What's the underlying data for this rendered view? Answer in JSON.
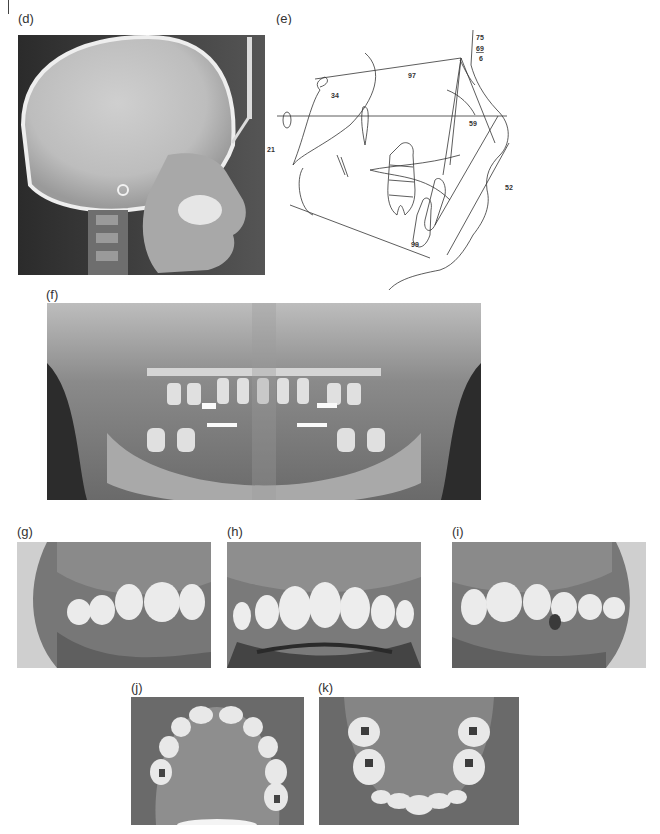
{
  "figure": {
    "panels": [
      {
        "id": "d",
        "label": "(d)",
        "description": "Lateral cephalometric radiograph"
      },
      {
        "id": "e",
        "label": "(e)",
        "description": "Cephalometric tracing"
      },
      {
        "id": "f",
        "label": "(f)",
        "description": "Panoramic radiograph"
      },
      {
        "id": "g",
        "label": "(g)",
        "description": "Intraoral photo, right buccal"
      },
      {
        "id": "h",
        "label": "(h)",
        "description": "Intraoral photo, frontal"
      },
      {
        "id": "i",
        "label": "(i)",
        "description": "Intraoral photo, left buccal"
      },
      {
        "id": "j",
        "label": "(j)",
        "description": "Maxillary occlusal photo"
      },
      {
        "id": "k",
        "label": "(k)",
        "description": "Mandibular occlusal photo"
      }
    ],
    "tracing_values": {
      "top_1": "75",
      "top_2": "69",
      "top_3": "6",
      "saddle": "34",
      "upper_mid": "97",
      "left_edge": "21",
      "right_mid": "59",
      "right_low": "52",
      "bottom": "99"
    },
    "colors": {
      "background": "#ffffff",
      "xray_dark": "#2a2a2a",
      "xray_light": "#e8e8e8",
      "tracing_line": "#333333"
    }
  }
}
